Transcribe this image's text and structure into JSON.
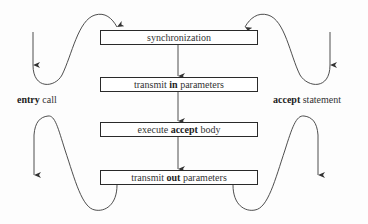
{
  "diagram": {
    "boxes": [
      {
        "pre": "synchronization",
        "bold": "",
        "post": ""
      },
      {
        "pre": "transmit ",
        "bold": "in",
        "post": " parameters"
      },
      {
        "pre": "execute ",
        "bold": "accept",
        "post": " body"
      },
      {
        "pre": "transmit ",
        "bold": "out",
        "post": " parameters"
      }
    ],
    "left_label": {
      "bold": "entry",
      "post": " call"
    },
    "right_label": {
      "bold": "accept",
      "post": " statement"
    },
    "colors": {
      "line": "#3a3a3a",
      "text": "#333333",
      "background": "#fdfdfd"
    }
  }
}
